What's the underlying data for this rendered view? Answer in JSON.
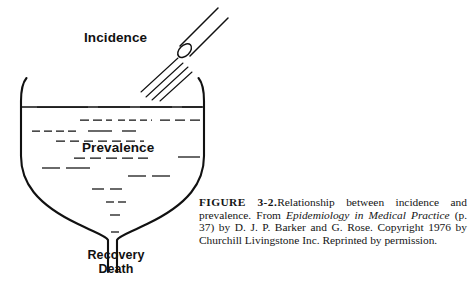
{
  "figure": {
    "diagram": {
      "type": "conceptual-funnel-diagram",
      "incidence_label": "Incidence",
      "prevalence_label": "Prevalence",
      "outcome_labels": [
        "Recovery",
        "Death"
      ],
      "elements": {
        "pipe": "nozzle-pipe",
        "spray": "incidence-inflow-stream",
        "vessel": "prevalence-pool-vessel",
        "neck": "outflow-neck",
        "liquid": "prevalence-liquid-dashes",
        "surface": "liquid-surface-line"
      },
      "ink_color": "#111111",
      "background_color": "#ffffff"
    }
  },
  "caption": {
    "figure_number": "FIGURE 3-2.",
    "text_1": "Relationship between incidence and prevalence. From ",
    "italic_1": "Epidemiology in Medical Practice",
    "text_2": " (p. 37) by D. J. P. Barker and G. Rose. Copyright 1976 by Churchill Livingstone Inc. Reprinted by permission."
  }
}
